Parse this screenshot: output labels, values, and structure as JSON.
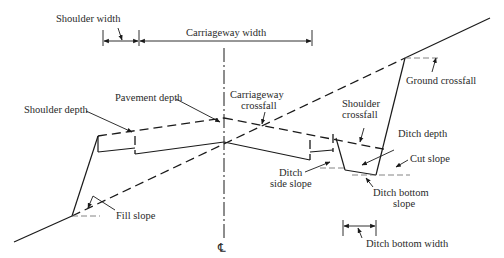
{
  "diagram": {
    "centreline_symbol": "℄",
    "labels": {
      "shoulder_width": "Shoulder width",
      "carriageway_width": "Carriageway width",
      "ground_crossfall": "Ground crossfall",
      "pavement_depth": "Pavement depth",
      "carriageway_crossfall_1": "Carriageway",
      "carriageway_crossfall_2": "crossfall",
      "shoulder_depth": "Shoulder depth",
      "shoulder_crossfall_1": "Shoulder",
      "shoulder_crossfall_2": "crossfall",
      "ditch_depth": "Ditch depth",
      "cut_slope": "Cut slope",
      "ditch_side_slope_1": "Ditch",
      "ditch_side_slope_2": "side slope",
      "ditch_bottom_slope_1": "Ditch bottom",
      "ditch_bottom_slope_2": "slope",
      "fill_slope": "Fill slope",
      "ditch_bottom_width": "Ditch bottom width"
    }
  }
}
